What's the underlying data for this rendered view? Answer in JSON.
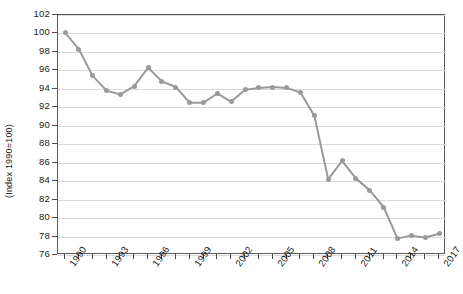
{
  "chart_data": {
    "type": "line",
    "title": "",
    "subtitle": "",
    "xlabel": "",
    "ylabel": "(Index 1990=100)",
    "ylim": [
      76,
      102
    ],
    "ytick_step": 2,
    "ytick_labels": [
      "76",
      "78",
      "80",
      "82",
      "84",
      "86",
      "88",
      "90",
      "92",
      "94",
      "96",
      "98",
      "100",
      "102"
    ],
    "xlim": [
      1990,
      2017
    ],
    "xtick_labels": [
      "1990",
      "1993",
      "1996",
      "1999",
      "2002",
      "2005",
      "2008",
      "2011",
      "2014",
      "2017"
    ],
    "xtick_label_every": 3,
    "xtick_minor_every": 1,
    "grid": true,
    "grid_axis": "y",
    "legend": false,
    "legend_position": "none",
    "line_color": "#9a9a9a",
    "marker_color": "#9a9a9a",
    "grid_color": "#d9d9d9",
    "axis_color": "#5a5a5a",
    "x": [
      1990,
      1991,
      1992,
      1993,
      1994,
      1995,
      1996,
      1997,
      1998,
      1999,
      2000,
      2001,
      2002,
      2003,
      2004,
      2005,
      2006,
      2007,
      2008,
      2009,
      2010,
      2011,
      2012,
      2013,
      2014,
      2015,
      2016,
      2017
    ],
    "series": [
      {
        "name": "Index",
        "values": [
          100.1,
          98.3,
          95.4,
          93.8,
          93.4,
          94.3,
          96.3,
          94.8,
          94.2,
          92.5,
          92.5,
          93.5,
          92.6,
          93.9,
          94.1,
          94.2,
          94.1,
          93.6,
          91.1,
          84.2,
          86.2,
          84.3,
          83.0,
          81.2,
          77.8,
          78.1,
          77.9,
          78.3
        ]
      }
    ]
  }
}
